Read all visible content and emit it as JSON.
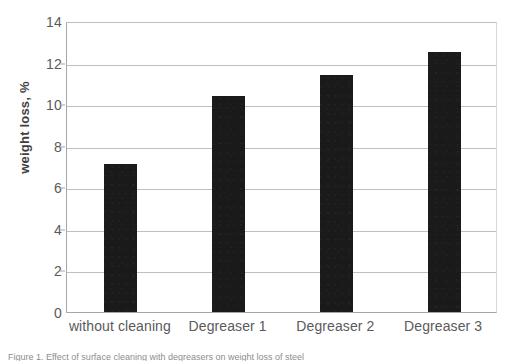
{
  "figure": {
    "background_color": "#ffffff",
    "caption": "Figure 1. Effect of surface cleaning with degreasers on weight loss of steel"
  },
  "chart_data": {
    "type": "bar",
    "title": "",
    "xlabel": "",
    "ylabel": "weight loss, %",
    "categories": [
      "without cleaning",
      "Degreaser 1",
      "Degreaser 2",
      "Degreaser 3"
    ],
    "values": [
      7.1,
      10.4,
      11.4,
      12.5
    ],
    "ylim": [
      0,
      14
    ],
    "ytick_values": [
      0,
      2,
      4,
      6,
      8,
      10,
      12,
      14
    ],
    "ytick_labels": [
      "0",
      "2",
      "4",
      "6",
      "8",
      "10",
      "12",
      "14"
    ],
    "bar_color": "#1a1a1a",
    "grid": "horizontal",
    "gridline_color": "#bfbfbf",
    "axis_color": "#a6a6a6",
    "tick_label_color": "#5a5a5a",
    "legend": null,
    "legend_position": "none"
  }
}
